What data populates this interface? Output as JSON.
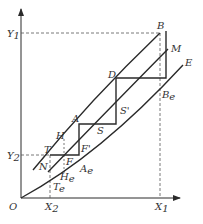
{
  "diagram": {
    "colors": {
      "line": "#2a2a2a",
      "dashed": "#555555",
      "text": "#333333",
      "background": "#ffffff"
    },
    "axes": {
      "origin_label": "O",
      "y_ticks": [
        {
          "label": "Y",
          "sub": "1"
        },
        {
          "label": "Y",
          "sub": "2"
        }
      ],
      "x_ticks": [
        {
          "label": "X",
          "sub": "2"
        },
        {
          "label": "X",
          "sub": "1"
        }
      ]
    },
    "points": {
      "B": "B",
      "M": "M",
      "E": "E",
      "D": "D",
      "Be": {
        "label": "B",
        "sub": "e"
      },
      "S_prime": "S'",
      "A": "A",
      "S": "S",
      "H": "H",
      "T": "T",
      "F_prime": "F'",
      "F": "F",
      "N": "N",
      "Ae": {
        "label": "A",
        "sub": "e"
      },
      "He": {
        "label": "H",
        "sub": "e"
      },
      "Te": {
        "label": "T",
        "sub": "e"
      }
    }
  }
}
